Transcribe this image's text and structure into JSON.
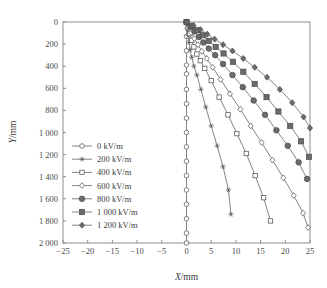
{
  "chart_data": {
    "type": "line",
    "title": "",
    "xlabel": "X/mm",
    "ylabel": "Y/mm",
    "xlim": [
      -25,
      25
    ],
    "ylim": [
      0,
      2000
    ],
    "y_axis_inverted": true,
    "grid": false,
    "legend_position": "center-left",
    "xticks": [
      -25,
      -20,
      -15,
      -10,
      -5,
      0,
      5,
      10,
      15,
      20,
      25
    ],
    "xtick_labels": [
      "-25",
      "-20",
      "-15",
      "-10",
      "-5",
      "0",
      "5",
      "10",
      "15",
      "20",
      "25"
    ],
    "yticks": [
      0,
      200,
      400,
      600,
      800,
      1000,
      1200,
      1400,
      1600,
      1800,
      2000
    ],
    "ytick_labels": [
      "0",
      "200",
      "400",
      "600",
      "800",
      "1 000",
      "1 200",
      "1 400",
      "1 600",
      "1 800",
      "2 000"
    ],
    "series": [
      {
        "name": "0 kV/m",
        "marker": "circle-open",
        "x": [
          0,
          0,
          0,
          0,
          0,
          0,
          0,
          0,
          0,
          0,
          0,
          0,
          0,
          0,
          0,
          0,
          0
        ],
        "y": [
          0,
          130,
          260,
          390,
          470,
          610,
          740,
          870,
          1000,
          1130,
          1260,
          1390,
          1520,
          1650,
          1780,
          1910,
          2000
        ]
      },
      {
        "name": "200 kV/m",
        "marker": "star",
        "x": [
          0,
          0.15,
          0.3,
          0.5,
          0.75,
          1.05,
          1.5,
          2.1,
          2.9,
          3.9,
          5.0,
          6.2,
          7.4,
          8.5,
          9.0
        ],
        "y": [
          0,
          60,
          120,
          185,
          250,
          320,
          400,
          480,
          610,
          770,
          940,
          1120,
          1310,
          1520,
          1740
        ]
      },
      {
        "name": "400 kV/m",
        "marker": "square-open",
        "x": [
          0,
          0.3,
          0.65,
          1.05,
          1.5,
          2.1,
          2.8,
          3.7,
          5.0,
          6.6,
          8.4,
          10.2,
          12.1,
          13.9,
          15.6,
          17.0
        ],
        "y": [
          0,
          50,
          105,
          165,
          225,
          290,
          350,
          420,
          530,
          680,
          840,
          1010,
          1190,
          1390,
          1590,
          1800
        ]
      },
      {
        "name": "600 kV/m",
        "marker": "diamond-open",
        "x": [
          0,
          0.5,
          1.0,
          1.6,
          2.3,
          3.1,
          4.1,
          5.3,
          6.9,
          8.8,
          10.9,
          13.0,
          15.2,
          17.4,
          19.6,
          21.7,
          23.6,
          24.6
        ],
        "y": [
          0,
          45,
          95,
          150,
          205,
          265,
          330,
          410,
          520,
          650,
          790,
          940,
          1090,
          1250,
          1410,
          1570,
          1730,
          1860
        ]
      },
      {
        "name": "800 kV/m",
        "marker": "circle-filled",
        "x": [
          0,
          0.8,
          1.6,
          2.5,
          3.4,
          4.5,
          5.8,
          7.4,
          9.3,
          11.4,
          13.6,
          15.9,
          18.2,
          20.5,
          22.7,
          24.4
        ],
        "y": [
          0,
          40,
          85,
          135,
          185,
          240,
          300,
          380,
          480,
          590,
          710,
          840,
          980,
          1120,
          1270,
          1420
        ]
      },
      {
        "name": "1 000 kV/m",
        "marker": "square-filled",
        "x": [
          0,
          1.1,
          2.2,
          3.3,
          4.5,
          5.9,
          7.5,
          9.4,
          11.5,
          13.8,
          16.2,
          18.6,
          21.0,
          23.2,
          24.8
        ],
        "y": [
          0,
          35,
          75,
          120,
          170,
          225,
          285,
          360,
          450,
          560,
          680,
          810,
          940,
          1080,
          1220
        ]
      },
      {
        "name": "1 200 kV/m",
        "marker": "diamond-filled",
        "x": [
          0,
          1.4,
          2.8,
          4.2,
          5.7,
          7.4,
          9.3,
          11.5,
          13.8,
          16.3,
          18.9,
          21.4,
          23.7,
          25.0
        ],
        "y": [
          0,
          32,
          68,
          110,
          155,
          205,
          262,
          330,
          410,
          500,
          610,
          730,
          860,
          960
        ]
      }
    ],
    "legend": [
      {
        "label": "0 kV/m",
        "marker": "circle-open"
      },
      {
        "label": "200 kV/m",
        "marker": "star"
      },
      {
        "label": "400 kV/m",
        "marker": "square-open"
      },
      {
        "label": "600 kV/m",
        "marker": "diamond-open"
      },
      {
        "label": "800 kV/m",
        "marker": "circle-filled"
      },
      {
        "label": "1 000 kV/m",
        "marker": "square-filled"
      },
      {
        "label": "1 200 kV/m",
        "marker": "diamond-filled"
      }
    ],
    "colors": {
      "line": "#6e6e6e",
      "marker_fill": "#6b6b6b",
      "marker_open_fill": "#ffffff",
      "axis": "#8d8d8d",
      "text": "#3a3a3a",
      "background": "#ffffff"
    }
  }
}
